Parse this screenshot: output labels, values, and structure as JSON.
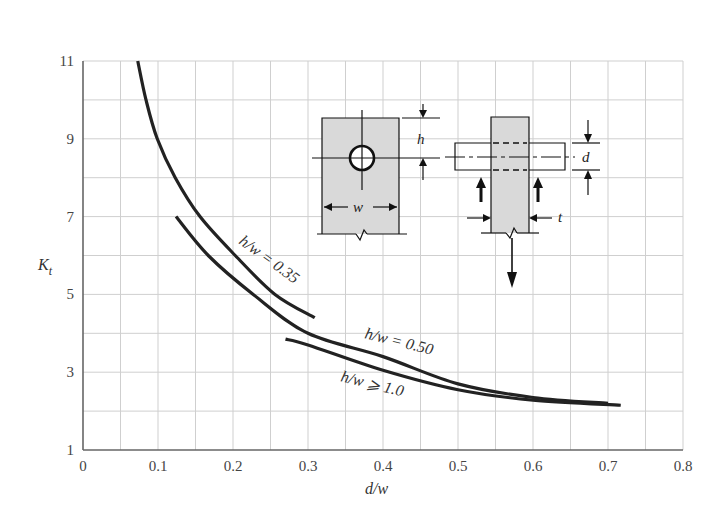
{
  "chart_data": {
    "type": "line",
    "title": "",
    "xlabel": "d/w",
    "ylabel": "K_t",
    "xlim": [
      0,
      0.8
    ],
    "ylim": [
      1,
      11
    ],
    "grid": true,
    "x_ticks": [
      "0",
      "0.1",
      "0.2",
      "0.3",
      "0.4",
      "0.5",
      "0.6",
      "0.7",
      "0.8"
    ],
    "y_ticks": [
      "1",
      "3",
      "5",
      "7",
      "9",
      "11"
    ],
    "legend": "none (curves labeled inline)",
    "series": [
      {
        "name": "h/w = 0.35",
        "label": "h/w = 0.35",
        "x": [
          0.073,
          0.084,
          0.099,
          0.123,
          0.156,
          0.203,
          0.256,
          0.309
        ],
        "y": [
          11.0,
          10.0,
          9.0,
          8.0,
          7.0,
          6.0,
          5.0,
          4.4
        ]
      },
      {
        "name": "h/w = 0.50",
        "label": "h/w = 0.50",
        "x": [
          0.124,
          0.167,
          0.227,
          0.3,
          0.4,
          0.5,
          0.6,
          0.7
        ],
        "y": [
          7.0,
          6.0,
          5.0,
          4.0,
          3.4,
          2.7,
          2.35,
          2.2
        ]
      },
      {
        "name": "h/w >= 1.0",
        "label": "h/w ⩾ 1.0",
        "x": [
          0.27,
          0.3,
          0.4,
          0.5,
          0.6,
          0.717
        ],
        "y": [
          3.85,
          3.7,
          3.05,
          2.55,
          2.28,
          2.15
        ]
      }
    ],
    "annotations": {
      "inset_left": {
        "description": "plate with centered hole",
        "labels": [
          "h",
          "w"
        ]
      },
      "inset_right": {
        "description": "pin-loaded lug, side view",
        "labels": [
          "d",
          "t"
        ]
      }
    }
  },
  "axes": {
    "xlabel": "d/w",
    "ylabel_main": "K",
    "ylabel_sub": "t"
  },
  "inset": {
    "h_label": "h",
    "w_label": "w",
    "d_label": "d",
    "t_label": "t"
  }
}
